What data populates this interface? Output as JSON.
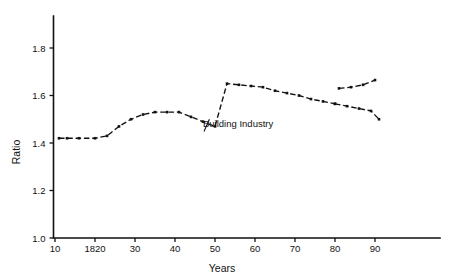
{
  "chart_data": {
    "type": "line",
    "title": "",
    "xlabel": "Years",
    "ylabel": "Ratio",
    "xlim": [
      10,
      97
    ],
    "ylim": [
      1.0,
      1.9
    ],
    "grid": false,
    "legend_position": "inline-annotation",
    "x_ticks": [
      {
        "value": 10,
        "label": "10"
      },
      {
        "value": 20,
        "label": "1820"
      },
      {
        "value": 30,
        "label": "30"
      },
      {
        "value": 40,
        "label": "40"
      },
      {
        "value": 50,
        "label": "50"
      },
      {
        "value": 60,
        "label": "60"
      },
      {
        "value": 70,
        "label": "70"
      },
      {
        "value": 80,
        "label": "80"
      },
      {
        "value": 90,
        "label": "90"
      }
    ],
    "y_ticks": [
      {
        "value": 1.0,
        "label": "1.0"
      },
      {
        "value": 1.2,
        "label": "1.2"
      },
      {
        "value": 1.4,
        "label": "1.4"
      },
      {
        "value": 1.6,
        "label": "1.6"
      },
      {
        "value": 1.8,
        "label": "1.8"
      }
    ],
    "annotations": [
      {
        "text": "Building Industry",
        "x": 50,
        "y": 1.47
      }
    ],
    "series": [
      {
        "name": "Building Industry",
        "style": "dashed",
        "x": [
          11,
          13,
          16,
          20,
          23,
          26,
          29,
          32,
          35,
          38,
          41,
          44,
          47,
          50,
          53,
          56,
          59,
          62,
          65,
          68,
          71,
          74,
          77,
          80
        ],
        "values": [
          1.42,
          1.42,
          1.42,
          1.42,
          1.43,
          1.47,
          1.5,
          1.52,
          1.53,
          1.53,
          1.53,
          1.51,
          1.49,
          1.47,
          1.65,
          1.645,
          1.64,
          1.635,
          1.62,
          1.61,
          1.6,
          1.585,
          1.575,
          1.565
        ]
      },
      {
        "name": "Building Industry (lower branch)",
        "style": "dashed",
        "x": [
          80,
          83,
          86,
          89,
          91
        ],
        "values": [
          1.565,
          1.555,
          1.545,
          1.535,
          1.5
        ]
      },
      {
        "name": "Building Industry (upper branch)",
        "style": "dashed",
        "x": [
          81,
          84,
          87,
          90
        ],
        "values": [
          1.63,
          1.635,
          1.645,
          1.665
        ]
      }
    ]
  },
  "axis": {
    "x_label": "Years",
    "y_label": "Ratio"
  }
}
